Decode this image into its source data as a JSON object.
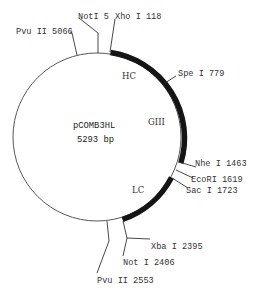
{
  "plasmid": {
    "name": "pCOMB3HL",
    "size_label": "5293 bp",
    "total_bp": 5293
  },
  "regions": [
    {
      "id": "hc",
      "label": "HC",
      "start": 118,
      "end": 779
    },
    {
      "id": "giii",
      "label": "GIII",
      "start": 779,
      "end": 1463
    },
    {
      "id": "lc",
      "label": "LC",
      "start": 1723,
      "end": 2395
    }
  ],
  "sites": [
    {
      "id": "pvuii-5066",
      "label": "Pvu II 5066"
    },
    {
      "id": "noti-5",
      "label": "NotI 5"
    },
    {
      "id": "xhoi-118",
      "label": "Xho I 118"
    },
    {
      "id": "spei-779",
      "label": "Spe I 779"
    },
    {
      "id": "nhei-1463",
      "label": "Nhe I 1463"
    },
    {
      "id": "ecori-1619",
      "label": "EcoRI 1619"
    },
    {
      "id": "saci-1723",
      "label": "Sac I 1723"
    },
    {
      "id": "xbai-2395",
      "label": "Xba I 2395"
    },
    {
      "id": "noti-2406",
      "label": "Not I 2406"
    },
    {
      "id": "pvuii-2553",
      "label": "Pvu II 2553"
    }
  ],
  "colors": {
    "backbone": "#444444",
    "feature": "#151515",
    "text": "#333333",
    "background": "#ffffff"
  }
}
